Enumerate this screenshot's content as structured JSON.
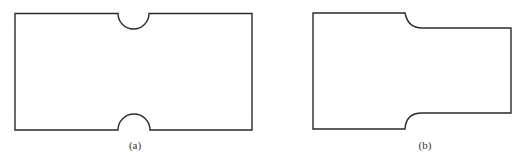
{
  "figures": [
    {
      "id": "a",
      "label": "(a)",
      "description": "Rectangular plate with semicircular notches on top and bottom edges"
    },
    {
      "id": "b",
      "label": "(b)",
      "description": "Stepped plate with filleted shoulder"
    }
  ],
  "colors": {
    "stroke": "#2a2a2a",
    "background": "#ffffff"
  }
}
